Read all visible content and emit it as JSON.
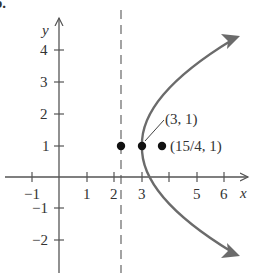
{
  "figure": {
    "panel_label": "b.",
    "axes": {
      "x_label": "x",
      "y_label": "y",
      "x_ticks": [
        {
          "value": -1,
          "label": "−1"
        },
        {
          "value": 1,
          "label": "1"
        },
        {
          "value": 2,
          "label": "2"
        },
        {
          "value": 3,
          "label": "3"
        },
        {
          "value": 4,
          "label": ""
        },
        {
          "value": 5,
          "label": "5"
        },
        {
          "value": 6,
          "label": "6"
        }
      ],
      "y_ticks": [
        {
          "value": 4,
          "label": "4"
        },
        {
          "value": 3,
          "label": "3"
        },
        {
          "value": 2,
          "label": "2"
        },
        {
          "value": 1,
          "label": "1"
        },
        {
          "value": -1,
          "label": "−1"
        },
        {
          "value": -2,
          "label": "−2"
        }
      ]
    },
    "directrix": {
      "x": 2.25,
      "style": "dashed"
    },
    "parabola": {
      "equation": "(y-1)^2 = 3(x-3)",
      "vertex": [
        3,
        1
      ],
      "opens": "right",
      "color": "#6b6b6b"
    },
    "points": [
      {
        "x": 2.25,
        "y": 1,
        "label": ""
      },
      {
        "x": 3,
        "y": 1,
        "label": "(3, 1)"
      },
      {
        "x": 3.75,
        "y": 1,
        "label": "(15/4, 1)"
      }
    ],
    "colors": {
      "axis": "#555555",
      "curve": "#6b6b6b",
      "point": "#111111",
      "text": "#333333"
    }
  }
}
